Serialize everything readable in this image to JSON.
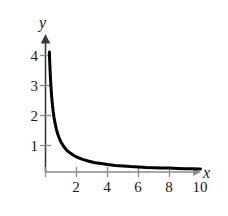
{
  "chart_data": {
    "type": "line",
    "title": "",
    "subtitle": "",
    "xlabel": "x",
    "ylabel": "y",
    "xlim": [
      0,
      11.2
    ],
    "ylim": [
      0,
      4.5
    ],
    "grid": false,
    "legend": null,
    "annotations": [],
    "x_ticks": [
      {
        "value": 2,
        "label": "2"
      },
      {
        "value": 4,
        "label": "4"
      },
      {
        "value": 6,
        "label": "6"
      },
      {
        "value": 8,
        "label": "8"
      },
      {
        "value": 10,
        "label": "10"
      }
    ],
    "y_ticks": [
      {
        "value": 1,
        "label": "1"
      },
      {
        "value": 2,
        "label": "2"
      },
      {
        "value": 3,
        "label": "3"
      },
      {
        "value": 4,
        "label": "4"
      }
    ],
    "series": [
      {
        "name": "y = 1/x",
        "color": "#000000",
        "line_width": 3,
        "x": [
          0.25,
          0.28,
          0.32,
          0.36,
          0.4,
          0.45,
          0.5,
          0.55,
          0.6,
          0.7,
          0.8,
          0.9,
          1.0,
          1.2,
          1.4,
          1.6,
          1.8,
          2.0,
          2.4,
          2.8,
          3.2,
          3.6,
          4.0,
          4.5,
          5.0,
          5.5,
          6.0,
          6.5,
          7.0,
          7.5,
          8.0,
          8.5,
          9.0,
          9.5,
          10.0
        ],
        "values": [
          4.0,
          3.57,
          3.13,
          2.78,
          2.5,
          2.22,
          2.0,
          1.82,
          1.67,
          1.43,
          1.25,
          1.11,
          1.0,
          0.83,
          0.71,
          0.63,
          0.56,
          0.5,
          0.42,
          0.36,
          0.31,
          0.28,
          0.25,
          0.22,
          0.2,
          0.18,
          0.17,
          0.15,
          0.14,
          0.13,
          0.13,
          0.12,
          0.11,
          0.11,
          0.1
        ]
      }
    ],
    "axis_color": "#8c8c8c",
    "tick_color": "#8c8c8c",
    "label_color": "#1a1a1a",
    "background": "#ffffff"
  }
}
